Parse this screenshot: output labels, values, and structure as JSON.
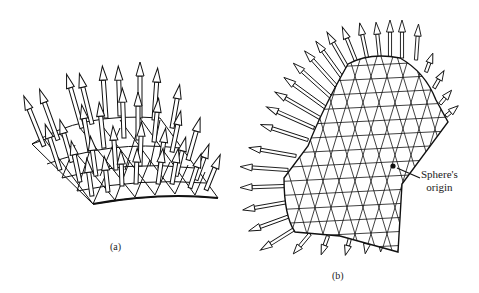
{
  "figure": {
    "panel_a": {
      "caption": "(a)",
      "description": "Patch of triangulated surface with normal arrows"
    },
    "panel_b": {
      "caption": "(b)",
      "description": "Triangulated sphere section with outward normal arrows",
      "annotation_line1": "Sphere's",
      "annotation_line2": "origin"
    },
    "colors": {
      "stroke": "#111111",
      "fill": "#ffffff",
      "background": "#ffffff"
    }
  }
}
